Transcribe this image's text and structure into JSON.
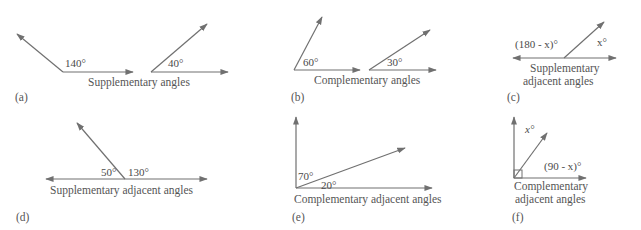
{
  "colors": {
    "line": "#707070",
    "text": "#4a4a4a",
    "caption": "#555555",
    "background": "#ffffff"
  },
  "panels": [
    {
      "id": "a",
      "tag": "(a)",
      "caption": [
        "Supplementary angles"
      ],
      "angles": [
        "140°",
        "40°"
      ]
    },
    {
      "id": "b",
      "tag": "(b)",
      "caption": [
        "Complementary angles"
      ],
      "angles": [
        "60°",
        "30°"
      ]
    },
    {
      "id": "c",
      "tag": "(c)",
      "caption": [
        "Supplementary",
        "adjacent angles"
      ],
      "angles": [
        "(180 - x)°",
        "x°"
      ]
    },
    {
      "id": "d",
      "tag": "(d)",
      "caption": [
        "Supplementary adjacent angles"
      ],
      "angles": [
        "50°",
        "130°"
      ]
    },
    {
      "id": "e",
      "tag": "(e)",
      "caption": [
        "Complementary adjacent angles"
      ],
      "angles": [
        "70°",
        "20°"
      ]
    },
    {
      "id": "f",
      "tag": "(f)",
      "caption": [
        "Complementary",
        "adjacent angles"
      ],
      "angles": [
        "x°",
        "(90 - x)°"
      ]
    }
  ]
}
